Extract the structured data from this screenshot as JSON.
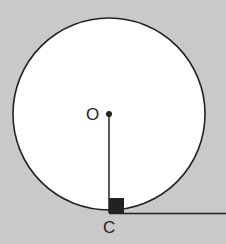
{
  "diagram": {
    "type": "geometry",
    "labels": {
      "center": "O",
      "tangent_point": "C"
    },
    "colors": {
      "background": "#c9c9c9",
      "circle_fill": "#ffffff",
      "stroke": "#222222"
    }
  }
}
